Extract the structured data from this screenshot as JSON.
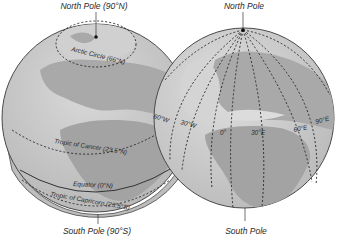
{
  "left_globe": {
    "title_top": "North Pole (90°N)",
    "title_bottom": "South Pole (90°S)",
    "parallels": [
      {
        "name": "arctic-circle",
        "label": "Arctic Circle (66°N)"
      },
      {
        "name": "tropic-of-cancer",
        "label": "Tropic of Cancer (23.5°N)"
      },
      {
        "name": "equator",
        "label": "Equator (0°N)"
      },
      {
        "name": "tropic-of-capricorn",
        "label": "Tropic of Capricorn (23.5°S)"
      }
    ]
  },
  "right_globe": {
    "title_top": "North Pole",
    "title_bottom": "South Pole",
    "meridians": [
      {
        "name": "60w",
        "label": "60°W"
      },
      {
        "name": "30w",
        "label": "30°W"
      },
      {
        "name": "0",
        "label": "0°"
      },
      {
        "name": "30e",
        "label": "30°E"
      },
      {
        "name": "60e",
        "label": "60°E"
      },
      {
        "name": "90e",
        "label": "90°E"
      }
    ]
  },
  "colors": {
    "ocean": "#c8c8c8",
    "land": "#a9a9a9",
    "land_light": "#dcdcdc",
    "outline": "#4a4a4a",
    "line": "#222222"
  }
}
